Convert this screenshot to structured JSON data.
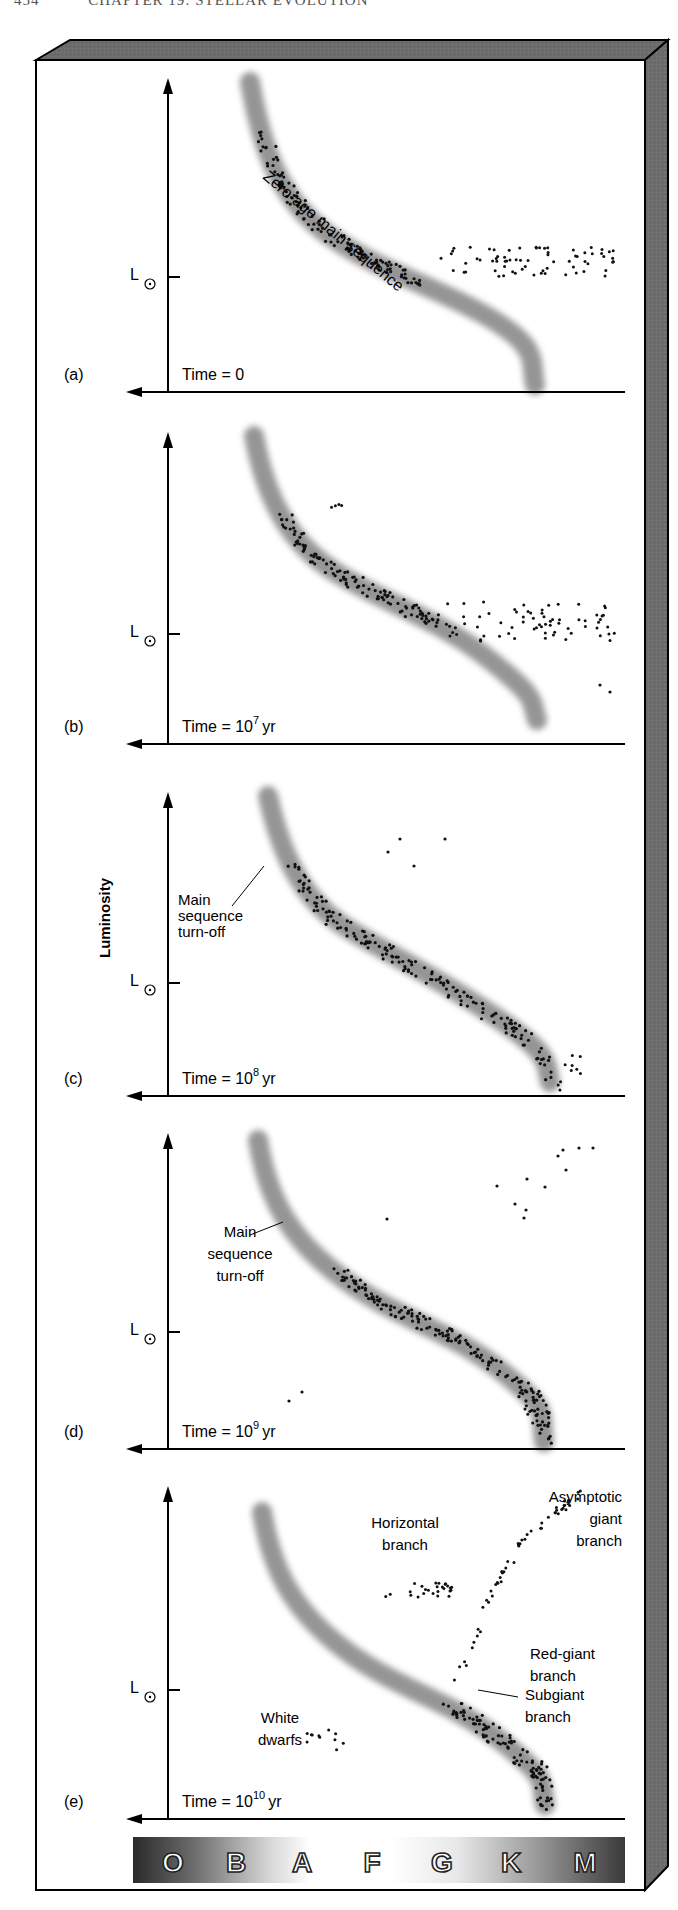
{
  "header": {
    "page_number": "454",
    "chapter_title": "CHAPTER 19: STELLAR EVOLUTION"
  },
  "colors": {
    "frame_gray": "#6e6e6e",
    "band_gray": "#8a8a8a",
    "dot": "#111111"
  },
  "y_axis_label": "Luminosity",
  "solar_luminosity_label": "L",
  "spectral_classes": [
    "O",
    "B",
    "A",
    "F",
    "G",
    "K",
    "M"
  ],
  "chart_data": [
    {
      "type": "scatter",
      "panel": "(a)",
      "title": "Time = 0",
      "time_base": "Time = 0",
      "time_exp": "",
      "time_unit": "",
      "xlabel": "Spectral class (O B A F G K M)",
      "ylabel": "Luminosity",
      "annotations": [
        "Zero-age main sequence"
      ],
      "description": "All stars lie on the zero-age main sequence; faint red stars scatter to the right of the band."
    },
    {
      "type": "scatter",
      "panel": "(b)",
      "title": "Time = 10^7 yr",
      "time_base": "Time = 10",
      "time_exp": "7",
      "time_unit": "yr",
      "xlabel": "Spectral class",
      "ylabel": "Luminosity",
      "annotations": [],
      "description": "The most massive stars have left the main sequence; a few giants appear upper-center."
    },
    {
      "type": "scatter",
      "panel": "(c)",
      "title": "Time = 10^8 yr",
      "time_base": "Time = 10",
      "time_exp": "8",
      "time_unit": "yr",
      "xlabel": "Spectral class",
      "ylabel": "Luminosity",
      "annotations": [
        "Main sequence turn-off"
      ],
      "description": "The turn-off moves down the main sequence; giants sit above."
    },
    {
      "type": "scatter",
      "panel": "(d)",
      "title": "Time = 10^9 yr",
      "time_base": "Time = 10",
      "time_exp": "9",
      "time_unit": "yr",
      "xlabel": "Spectral class",
      "ylabel": "Luminosity",
      "annotations": [
        "Main sequence turn-off"
      ],
      "description": "Red giants in the upper right; the first white dwarfs appear lower left."
    },
    {
      "type": "scatter",
      "panel": "(e)",
      "title": "Time = 10^10 yr",
      "time_base": "Time = 10",
      "time_exp": "10",
      "time_unit": "yr",
      "xlabel": "Spectral class",
      "ylabel": "Luminosity",
      "annotations": [
        "Horizontal branch",
        "Asymptotic giant branch",
        "Red-giant branch",
        "Subgiant branch",
        "White dwarfs"
      ],
      "description": "Old cluster: low-mass main sequence, subgiant, red-giant, horizontal and asymptotic giant branches, and white dwarfs."
    }
  ],
  "panels": [
    {
      "label": "(a)",
      "axis_top": 78,
      "axis_bottom": 392,
      "lsun_y": 277,
      "band": "M250,82 C262,150 280,200 330,236 S440,288 490,318 S530,360 535,385",
      "time_parts": [
        "Time = 0",
        "",
        ""
      ]
    },
    {
      "label": "(b)",
      "axis_top": 432,
      "axis_bottom": 744,
      "lsun_y": 634,
      "band": "M254,436 C266,500 290,545 340,575 S440,620 490,660 S530,700 537,720",
      "time_parts": [
        "Time = 10",
        "7",
        "yr"
      ]
    },
    {
      "label": "(c)",
      "axis_top": 792,
      "axis_bottom": 1096,
      "lsun_y": 983,
      "band": "M268,796 C280,850 300,900 350,930 S450,985 500,1020 S545,1060 550,1082",
      "time_parts": [
        "Time = 10",
        "8",
        "yr"
      ]
    },
    {
      "label": "(d)",
      "axis_top": 1133,
      "axis_bottom": 1449,
      "lsun_y": 1332,
      "band": "M258,1140 C268,1200 290,1240 345,1280 S450,1330 500,1370 S540,1410 544,1442",
      "time_parts": [
        "Time = 10",
        "9",
        "yr"
      ]
    },
    {
      "label": "(e)",
      "axis_top": 1486,
      "axis_bottom": 1819,
      "lsun_y": 1690,
      "band": "M262,1512 C272,1570 292,1610 345,1650 S450,1700 500,1740 S540,1780 545,1805",
      "time_parts": [
        "Time = 10",
        "10",
        "yr"
      ]
    }
  ],
  "annotations": {
    "zams": "Zero-age main sequence",
    "turnoff_c": [
      "Main",
      "sequence",
      "turn-off"
    ],
    "turnoff_d": [
      "Main",
      "sequence",
      "turn-off"
    ],
    "horizontal_branch": [
      "Horizontal",
      "branch"
    ],
    "agb": [
      "Asymptotic",
      "giant",
      "branch"
    ],
    "rgb": [
      "Red-giant",
      "branch"
    ],
    "subgiant": [
      "Subgiant",
      "branch"
    ],
    "white_dwarfs": [
      "White",
      "dwarfs"
    ]
  }
}
